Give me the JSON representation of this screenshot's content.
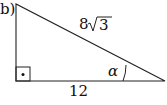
{
  "part_label": "b)",
  "triangle": {
    "hypotenuse_label": "8",
    "hypotenuse_radicand": "3",
    "base_label": "12",
    "angle_label": "α",
    "right_angle_marker": "square-with-dot"
  },
  "colors": {
    "stroke": "#222222",
    "background": "#ffffff"
  }
}
